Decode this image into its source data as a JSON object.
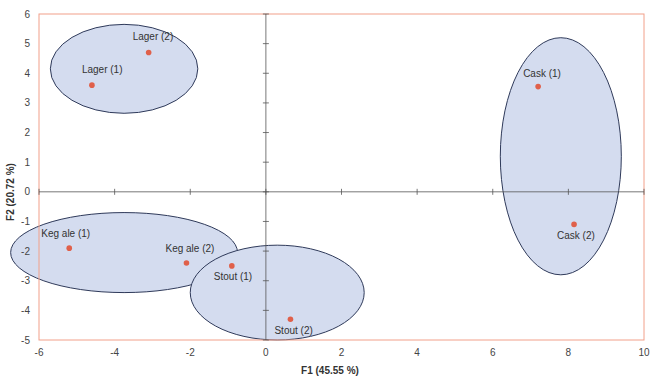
{
  "chart_data": {
    "type": "scatter",
    "title": "",
    "xlabel": "F1 (45.55 %)",
    "ylabel": "F2 (20.72 %)",
    "xlim": [
      -6,
      10
    ],
    "ylim": [
      -5,
      6
    ],
    "xticks": [
      -6,
      -4,
      -2,
      0,
      2,
      4,
      6,
      8,
      10
    ],
    "yticks": [
      -5,
      -4,
      -3,
      -2,
      -1,
      0,
      1,
      2,
      3,
      4,
      5,
      6
    ],
    "grid": false,
    "legend": null,
    "points": [
      {
        "label": "Lager (1)",
        "x": -4.6,
        "y": 3.6
      },
      {
        "label": "Lager (2)",
        "x": -3.1,
        "y": 4.7
      },
      {
        "label": "Keg ale (1)",
        "x": -5.2,
        "y": -1.9
      },
      {
        "label": "Keg ale (2)",
        "x": -2.1,
        "y": -2.4
      },
      {
        "label": "Stout (1)",
        "x": -0.9,
        "y": -2.5
      },
      {
        "label": "Stout (2)",
        "x": 0.65,
        "y": -4.3
      },
      {
        "label": "Cask (1)",
        "x": 7.2,
        "y": 3.55
      },
      {
        "label": "Cask (2)",
        "x": 8.15,
        "y": -1.1
      }
    ],
    "groups": [
      {
        "name": "Lager",
        "cx": -3.75,
        "cy": 4.15,
        "rx": 1.95,
        "ry": 1.5
      },
      {
        "name": "Keg ale",
        "cx": -3.75,
        "cy": -2.05,
        "rx": 3.0,
        "ry": 1.35
      },
      {
        "name": "Stout",
        "cx": 0.3,
        "cy": -3.4,
        "rx": 2.3,
        "ry": 1.6
      },
      {
        "name": "Cask",
        "cx": 7.8,
        "cy": 1.2,
        "rx": 1.6,
        "ry": 4.0
      }
    ],
    "colors": {
      "point": "#e0604a",
      "ellipse_fill": "#d4dcef",
      "ellipse_stroke": "#2f3a5a",
      "frame": "#f2a08a",
      "axis": "#555555"
    }
  }
}
